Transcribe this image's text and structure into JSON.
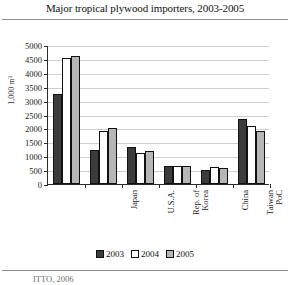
{
  "title": "Major tropical plywood importers, 2003-2005",
  "source_note": "ITTO, 2006",
  "legend": {
    "items": [
      {
        "label": "2003",
        "color": "#3b3b3b"
      },
      {
        "label": "2004",
        "color": "#ffffff"
      },
      {
        "label": "2005",
        "color": "#b6b6b6"
      }
    ]
  },
  "chart_data": {
    "type": "bar",
    "title": "Major tropical plywood importers, 2003-2005",
    "xlabel": "",
    "ylabel": "1,000 m³",
    "ylim": [
      0,
      5000
    ],
    "yticks": [
      0,
      500,
      1000,
      1500,
      2000,
      2500,
      3000,
      3500,
      4000,
      4500,
      5000
    ],
    "ytick_labels": [
      "0",
      "500",
      "1000",
      "1500",
      "2000",
      "2500",
      "3000",
      "3500",
      "4000",
      "4500",
      "5000"
    ],
    "grid": true,
    "legend_position": "bottom",
    "categories": [
      "Japan",
      "U.S.A.",
      "Rep. of Korea",
      "China",
      "Taiwan PoC",
      "Others"
    ],
    "category_lines": [
      [
        "Japan"
      ],
      [
        "U.S.A."
      ],
      [
        "Rep. of",
        "Korea"
      ],
      [
        "China"
      ],
      [
        "Taiwan",
        "PoC"
      ],
      [
        "Others"
      ]
    ],
    "series": [
      {
        "name": "2003",
        "color": "#3b3b3b",
        "values": [
          3250,
          1230,
          1320,
          660,
          520,
          2350
        ]
      },
      {
        "name": "2004",
        "color": "#ffffff",
        "values": [
          4550,
          1900,
          1100,
          655,
          600,
          2100
        ]
      },
      {
        "name": "2005",
        "color": "#b6b6b6",
        "values": [
          4600,
          2000,
          1200,
          665,
          570,
          1900
        ]
      }
    ]
  }
}
